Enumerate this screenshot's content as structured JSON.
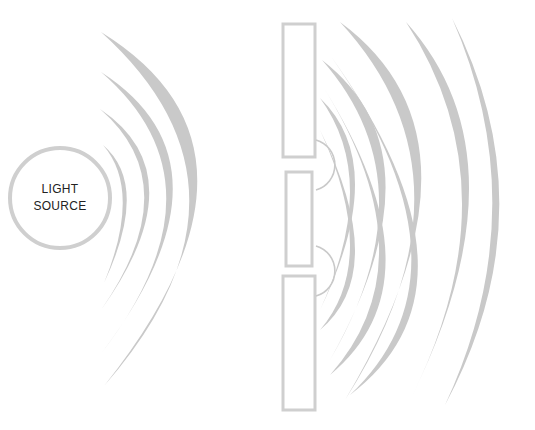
{
  "diagram": {
    "source": {
      "label_line1": "LIGHT",
      "label_line2": "SOURCE",
      "cx": 60,
      "cy": 198,
      "r": 50
    },
    "colors": {
      "wave": "#c9c9c9",
      "barrier": "#cfcfcf",
      "text": "#222222",
      "background": "#ffffff"
    },
    "incident_wave_count": 4,
    "barrier": {
      "x": 283,
      "width": 32,
      "blocks": [
        {
          "y": 24,
          "height": 133
        },
        {
          "y": 172,
          "height": 94
        },
        {
          "y": 276,
          "height": 134
        }
      ],
      "slits": [
        {
          "y": 165
        },
        {
          "y": 271
        }
      ]
    },
    "diffracted_waves_per_slit": 4
  }
}
